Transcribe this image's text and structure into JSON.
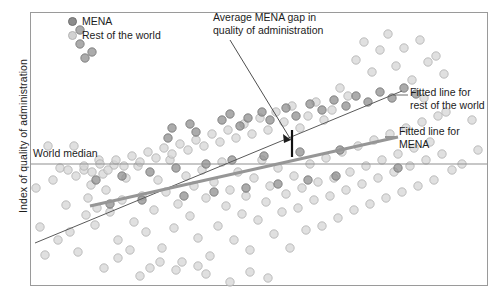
{
  "chart_data": {
    "type": "scatter",
    "title": "",
    "xlabel": "",
    "ylabel": "Index of quality of administration",
    "xlim": [
      0,
      100
    ],
    "ylim": [
      0,
      100
    ],
    "grid": false,
    "legend_position": "top-left",
    "legend": [
      {
        "label": "MENA",
        "color": "#8c8c8c"
      },
      {
        "label": "Rest of the world",
        "color": "#d2d2d2"
      }
    ],
    "annotations": [
      {
        "name": "gap-annotation",
        "text_line1": "Average MENA gap in",
        "text_line2": "quality of administration"
      },
      {
        "name": "fitted-row-annotation",
        "text_line1": "Fitted line for",
        "text_line2": "rest of the world"
      },
      {
        "name": "fitted-mena-annotation",
        "text_line1": "Fitted line for",
        "text_line2": "MENA"
      },
      {
        "name": "world-median-annotation",
        "text_line1": "World median"
      }
    ],
    "reference_lines": [
      {
        "name": "world-median",
        "orientation": "horizontal",
        "label": "World median",
        "y": 164,
        "color": "#8f8f8f"
      }
    ],
    "fit_lines": [
      {
        "name": "fitted-line-rest-of-world",
        "label": "Fitted line for rest of the world",
        "color": "#5a5a5a",
        "width": 1,
        "x1": 35,
        "y1": 243,
        "x2": 402,
        "y2": 91
      },
      {
        "name": "fitted-line-mena",
        "label": "Fitted line for MENA",
        "color": "#969696",
        "width": 3,
        "x1": 90,
        "y1": 206,
        "x2": 398,
        "y2": 137
      }
    ],
    "gap_marker": {
      "name": "mena-gap-marker",
      "x": 292,
      "y_top": 130,
      "y_bottom": 157
    },
    "series": [
      {
        "name": "Rest of the world",
        "color": "#d2d2d2",
        "points": [
          [
            48,
            146
          ],
          [
            53,
            180
          ],
          [
            60,
            168
          ],
          [
            74,
            146
          ],
          [
            86,
            215
          ],
          [
            88,
            198
          ],
          [
            97,
            208
          ],
          [
            103,
            174
          ],
          [
            36,
            188
          ],
          [
            40,
            227
          ],
          [
            45,
            255
          ],
          [
            58,
            240
          ],
          [
            66,
            205
          ],
          [
            70,
            232
          ],
          [
            78,
            252
          ],
          [
            84,
            170
          ],
          [
            91,
            185
          ],
          [
            95,
            225
          ],
          [
            99,
            160
          ],
          [
            106,
            190
          ],
          [
            110,
            212
          ],
          [
            114,
            165
          ],
          [
            118,
            240
          ],
          [
            122,
            200
          ],
          [
            126,
            178
          ],
          [
            130,
            250
          ],
          [
            134,
            222
          ],
          [
            138,
            166
          ],
          [
            142,
            196
          ],
          [
            146,
            232
          ],
          [
            150,
            268
          ],
          [
            154,
            210
          ],
          [
            158,
            180
          ],
          [
            162,
            248
          ],
          [
            166,
            192
          ],
          [
            170,
            160
          ],
          [
            174,
            228
          ],
          [
            178,
            204
          ],
          [
            182,
            262
          ],
          [
            186,
            176
          ],
          [
            190,
            216
          ],
          [
            194,
            186
          ],
          [
            198,
            238
          ],
          [
            202,
            170
          ],
          [
            206,
            198
          ],
          [
            210,
            256
          ],
          [
            214,
            182
          ],
          [
            218,
            226
          ],
          [
            222,
            162
          ],
          [
            226,
            206
          ],
          [
            230,
            190
          ],
          [
            234,
            240
          ],
          [
            238,
            172
          ],
          [
            242,
            214
          ],
          [
            246,
            196
          ],
          [
            250,
            250
          ],
          [
            254,
            178
          ],
          [
            258,
            220
          ],
          [
            262,
            160
          ],
          [
            266,
            202
          ],
          [
            270,
            186
          ],
          [
            274,
            234
          ],
          [
            278,
            168
          ],
          [
            282,
            212
          ],
          [
            286,
            194
          ],
          [
            290,
            248
          ],
          [
            294,
            176
          ],
          [
            298,
            208
          ],
          [
            302,
            188
          ],
          [
            306,
            230
          ],
          [
            310,
            164
          ],
          [
            314,
            200
          ],
          [
            318,
            182
          ],
          [
            322,
            226
          ],
          [
            326,
            158
          ],
          [
            330,
            196
          ],
          [
            334,
            178
          ],
          [
            338,
            218
          ],
          [
            342,
            152
          ],
          [
            346,
            190
          ],
          [
            350,
            172
          ],
          [
            354,
            210
          ],
          [
            358,
            146
          ],
          [
            362,
            184
          ],
          [
            366,
            166
          ],
          [
            370,
            204
          ],
          [
            374,
            140
          ],
          [
            378,
            178
          ],
          [
            382,
            160
          ],
          [
            386,
            198
          ],
          [
            390,
            134
          ],
          [
            394,
            172
          ],
          [
            398,
            154
          ],
          [
            402,
            192
          ],
          [
            406,
            128
          ],
          [
            410,
            166
          ],
          [
            414,
            148
          ],
          [
            418,
            186
          ],
          [
            422,
            122
          ],
          [
            426,
            160
          ],
          [
            430,
            142
          ],
          [
            434,
            180
          ],
          [
            438,
            116
          ],
          [
            442,
            154
          ],
          [
            356,
            60
          ],
          [
            364,
            42
          ],
          [
            372,
            72
          ],
          [
            380,
            50
          ],
          [
            388,
            34
          ],
          [
            396,
            66
          ],
          [
            404,
            48
          ],
          [
            412,
            80
          ],
          [
            420,
            40
          ],
          [
            428,
            62
          ],
          [
            436,
            56
          ],
          [
            444,
            74
          ],
          [
            340,
            88
          ],
          [
            348,
            96
          ],
          [
            332,
            110
          ],
          [
            324,
            120
          ],
          [
            316,
            102
          ],
          [
            308,
            116
          ],
          [
            300,
            128
          ],
          [
            292,
            106
          ],
          [
            284,
            122
          ],
          [
            276,
            112
          ],
          [
            268,
            130
          ],
          [
            260,
            118
          ],
          [
            252,
            134
          ],
          [
            244,
            124
          ],
          [
            236,
            138
          ],
          [
            228,
            130
          ],
          [
            220,
            142
          ],
          [
            212,
            134
          ],
          [
            204,
            146
          ],
          [
            196,
            140
          ],
          [
            188,
            150
          ],
          [
            180,
            144
          ],
          [
            172,
            154
          ],
          [
            164,
            148
          ],
          [
            156,
            158
          ],
          [
            148,
            152
          ],
          [
            140,
            162
          ],
          [
            132,
            156
          ],
          [
            124,
            166
          ],
          [
            116,
            160
          ],
          [
            108,
            170
          ],
          [
            100,
            164
          ],
          [
            92,
            172
          ],
          [
            84,
            166
          ],
          [
            76,
            176
          ],
          [
            68,
            170
          ],
          [
            206,
            274
          ],
          [
            230,
            282
          ],
          [
            250,
            272
          ],
          [
            268,
            278
          ],
          [
            140,
            276
          ],
          [
            176,
            270
          ],
          [
            104,
            268
          ],
          [
            424,
            98
          ],
          [
            446,
            112
          ],
          [
            452,
            170
          ],
          [
            462,
            164
          ],
          [
            472,
            120
          ],
          [
            478,
            150
          ],
          [
            160,
            262
          ],
          [
            198,
            266
          ],
          [
            118,
            258
          ]
        ]
      },
      {
        "name": "MENA",
        "color": "#8c8c8c",
        "points": [
          [
            80,
            30
          ],
          [
            80,
            44
          ],
          [
            85,
            58
          ],
          [
            92,
            52
          ],
          [
            168,
            138
          ],
          [
            172,
            128
          ],
          [
            190,
            124
          ],
          [
            196,
            132
          ],
          [
            222,
            120
          ],
          [
            230,
            114
          ],
          [
            240,
            126
          ],
          [
            248,
            118
          ],
          [
            262,
            112
          ],
          [
            270,
            120
          ],
          [
            286,
            108
          ],
          [
            296,
            116
          ],
          [
            310,
            104
          ],
          [
            322,
            110
          ],
          [
            334,
            100
          ],
          [
            346,
            106
          ],
          [
            356,
            96
          ],
          [
            368,
            102
          ],
          [
            380,
            92
          ],
          [
            392,
            98
          ],
          [
            404,
            88
          ],
          [
            416,
            94
          ],
          [
            398,
            168
          ],
          [
            340,
            150
          ],
          [
            300,
            152
          ],
          [
            264,
            156
          ],
          [
            232,
            160
          ],
          [
            206,
            164
          ],
          [
            176,
            168
          ],
          [
            150,
            172
          ],
          [
            122,
            176
          ],
          [
            96,
            180
          ],
          [
            142,
            200
          ],
          [
            110,
            204
          ],
          [
            184,
            196
          ],
          [
            214,
            192
          ],
          [
            246,
            188
          ],
          [
            278,
            184
          ],
          [
            308,
            180
          ],
          [
            336,
            176
          ]
        ]
      }
    ]
  }
}
